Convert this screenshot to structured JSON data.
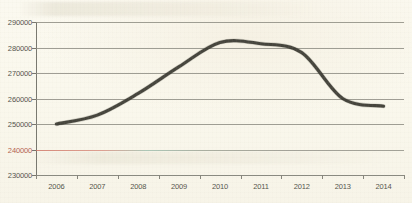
{
  "chart_data": {
    "type": "line",
    "title": "",
    "subtitle": "",
    "xlabel": "",
    "ylabel": "",
    "categories": [
      "2006",
      "2007",
      "2008",
      "2009",
      "2010",
      "2011",
      "2012",
      "2013",
      "2014"
    ],
    "x": [
      2006,
      2007,
      2008,
      2009,
      2010,
      2011,
      2012,
      2013,
      2014
    ],
    "series": [
      {
        "name": "",
        "values": [
          250000,
          253500,
          262000,
          272500,
          282000,
          281500,
          278000,
          260000,
          257000
        ]
      }
    ],
    "ylim": [
      230000,
      290000
    ],
    "yticks": [
      230000,
      240000,
      250000,
      260000,
      270000,
      280000,
      290000
    ],
    "ytick_labels": [
      "230000",
      "240000",
      "250000",
      "260000",
      "270000",
      "280000",
      "290000"
    ],
    "xtick_labels": [
      "2006",
      "2007",
      "2008",
      "2009",
      "2010",
      "2011",
      "2012",
      "2013",
      "2014"
    ],
    "grid": true,
    "grid_color": "#8e8d84",
    "highlighted_gridline_value": 240000,
    "highlighted_gridline_color": "#ce7060",
    "legend": null,
    "legend_position": "none",
    "line_color": "#3b3a33",
    "background_color": "#faf8ee",
    "axis_color": "#76756d"
  }
}
